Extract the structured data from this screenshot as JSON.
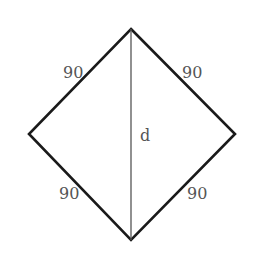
{
  "diagram": {
    "shape": "rhombus",
    "vertices": {
      "top": [
        131,
        29
      ],
      "right": [
        235,
        134
      ],
      "bottom": [
        131,
        240
      ],
      "left": [
        29,
        134
      ]
    },
    "stroke_color": "#1a1a1a",
    "diagonal_color": "#555555",
    "side_labels": {
      "top_left": "90",
      "top_right": "90",
      "bottom_left": "90",
      "bottom_right": "90"
    },
    "diagonal_label": "d"
  }
}
